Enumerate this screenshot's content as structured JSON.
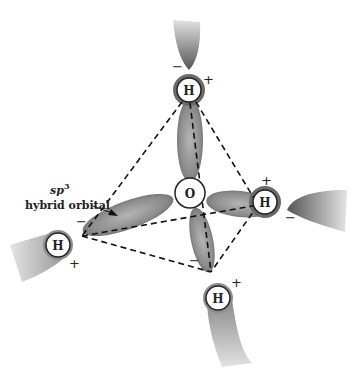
{
  "diagram": {
    "central_atom": {
      "label": "O",
      "x": 190,
      "y": 193
    },
    "hydrogens": [
      {
        "id": "top",
        "label": "H",
        "x": 189,
        "y": 90,
        "plus": "+",
        "minus": "−"
      },
      {
        "id": "right",
        "label": "H",
        "x": 265,
        "y": 202,
        "plus": "+",
        "minus": "−"
      },
      {
        "id": "left",
        "label": "H",
        "x": 58,
        "y": 245,
        "plus": "+",
        "minus": "−"
      },
      {
        "id": "bottom",
        "label": "H",
        "x": 218,
        "y": 298,
        "plus": "+",
        "minus": "−"
      }
    ],
    "annotation": {
      "line1_base": "sp",
      "line1_sup": "3",
      "line2": "hybrid orbital"
    },
    "colors": {
      "orbital": "#7a7a7a",
      "line": "#111111",
      "background": "#ffffff"
    }
  }
}
